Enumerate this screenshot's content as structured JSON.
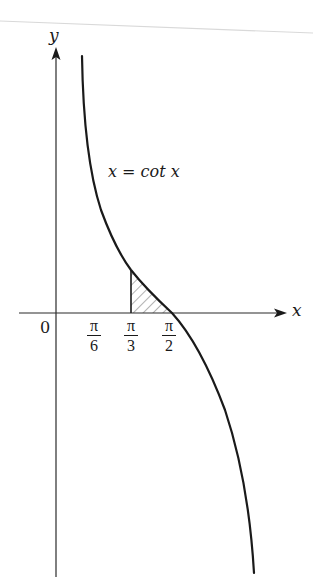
{
  "figure": {
    "type": "function-graph",
    "curve_label": "x = cot x",
    "axes": {
      "x_label": "x",
      "y_label": "y",
      "origin_label": "0"
    },
    "ticks": [
      {
        "id": "pi6",
        "numerator": "π",
        "denominator": "6",
        "value": "π/6"
      },
      {
        "id": "pi3",
        "numerator": "π",
        "denominator": "3",
        "value": "π/3"
      },
      {
        "id": "pi2",
        "numerator": "π",
        "denominator": "2",
        "value": "π/2"
      }
    ],
    "shaded_region": {
      "description": "hatched area under curve between x = π/3 and x = π/2",
      "from": "π/3",
      "to": "π/2"
    },
    "colors": {
      "ink": "#1a1a1a",
      "axis": "#2a2a2a",
      "hatch": "#555555",
      "background": "#ffffff",
      "scan_line": "#d9d9d9"
    }
  }
}
